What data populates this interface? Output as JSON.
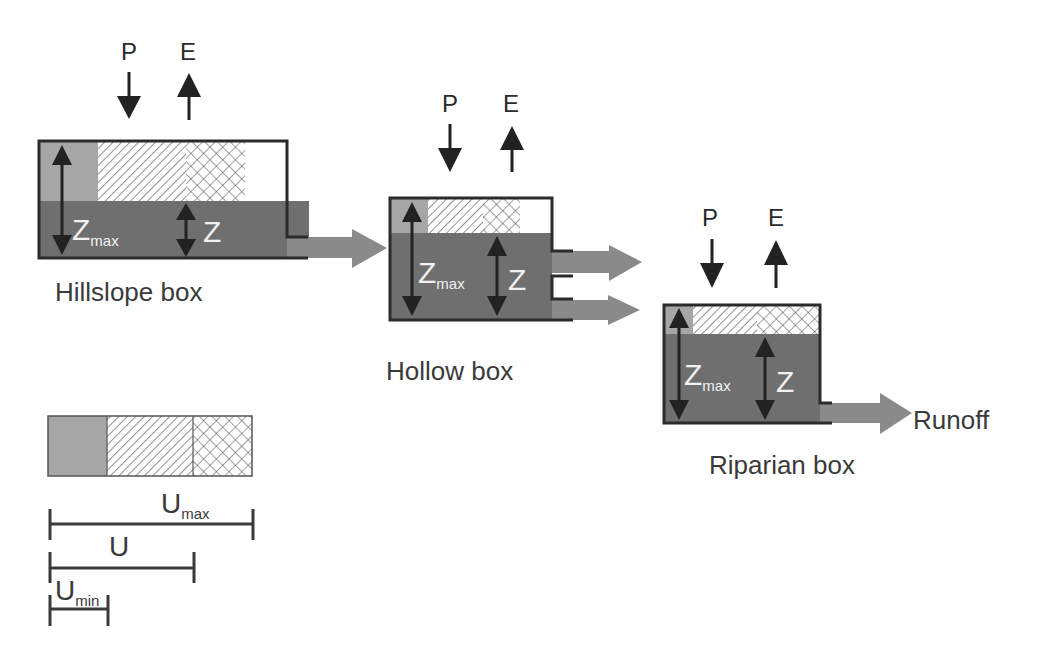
{
  "diagram": {
    "colors": {
      "water": "#6f6f6f",
      "wilting": "#a6a6a6",
      "outline": "#2b2b2b",
      "arrow_flow": "#8a8a8a",
      "arrow_pe": "#222222",
      "hatch": "#555555"
    },
    "boxes": [
      {
        "id": "hillslope",
        "label": "Hillslope box",
        "precip_label": "P",
        "evap_label": "E",
        "zmax_label": "Z",
        "zmax_sub": "max",
        "z_label": "Z",
        "outflows": 1
      },
      {
        "id": "hollow",
        "label": "Hollow box",
        "precip_label": "P",
        "evap_label": "E",
        "zmax_label": "Z",
        "zmax_sub": "max",
        "z_label": "Z",
        "outflows": 2
      },
      {
        "id": "riparian",
        "label": "Riparian box",
        "precip_label": "P",
        "evap_label": "E",
        "zmax_label": "Z",
        "zmax_sub": "max",
        "z_label": "Z",
        "outflows": 1
      }
    ],
    "runoff_label": "Runoff",
    "legend": {
      "segments": [
        "solid-grey",
        "diagonal-hatch",
        "cross-hatch"
      ],
      "umax": {
        "main": "U",
        "sub": "max"
      },
      "u": {
        "main": "U",
        "sub": ""
      },
      "umin": {
        "main": "U",
        "sub": "min"
      }
    }
  }
}
